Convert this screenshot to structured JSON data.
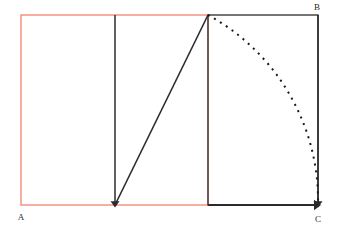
{
  "figure": {
    "width": 339,
    "height": 229,
    "background_color": "#ffffff"
  },
  "colors": {
    "red_rectangle": "#f2836b",
    "black_stroke": "#2b2b2b",
    "dashed_arc": "#1a1a1a",
    "label_text": "#2b2b2b"
  },
  "labels": [
    {
      "id": "A",
      "text": "A",
      "x": 21,
      "y": 220,
      "anchor": "middle",
      "description": "bottom-left vertex label"
    },
    {
      "id": "B",
      "text": "B",
      "x": 317,
      "y": 10,
      "anchor": "middle",
      "description": "top-right vertex label"
    },
    {
      "id": "C",
      "text": "C",
      "x": 318,
      "y": 222,
      "anchor": "middle",
      "description": "bottom-right vertex label"
    }
  ],
  "shapes": {
    "red_rectangle": {
      "name": "source-rectangle",
      "x": 21,
      "y": 15,
      "width": 187,
      "height": 190,
      "stroke": "#f2836b",
      "stroke_width": 1.3,
      "fill": "none"
    },
    "black_rectangle": {
      "name": "target-rectangle",
      "x": 208,
      "y": 15,
      "width": 110,
      "height": 190,
      "stroke": "#2b2b2b",
      "stroke_width": 1.3,
      "fill": "none"
    },
    "mid_vertical": {
      "name": "midpoint-vertical-line",
      "x1": 115,
      "y1": 15,
      "x2": 115,
      "y2": 205,
      "stroke": "#2b2b2b",
      "stroke_width": 1.5,
      "arrow_at_end": true
    },
    "diagonal": {
      "name": "diagonal-radius-line",
      "x1": 115,
      "y1": 205,
      "x2": 208,
      "y2": 15,
      "stroke": "#2b2b2b",
      "stroke_width": 1.6
    },
    "right_vertical": {
      "name": "right-edge-arrow-line",
      "x1": 318,
      "y1": 15,
      "x2": 318,
      "y2": 205,
      "stroke": "#2b2b2b",
      "stroke_width": 1.5,
      "arrow_at_end": true
    },
    "bottom_black": {
      "name": "bottom-edge-arrow-line",
      "x1": 208,
      "y1": 205,
      "x2": 318,
      "y2": 205,
      "stroke": "#2b2b2b",
      "stroke_width": 1.8,
      "arrow_at_end": true
    },
    "arc": {
      "name": "rotation-arc",
      "center_x": 115,
      "center_y": 205,
      "radius": 211,
      "start_x": 208,
      "start_y": 15,
      "end_x": 318,
      "end_y": 205,
      "path": "M 208 15 A 211 211 0 0 1 318 205",
      "stroke": "#1a1a1a",
      "stroke_width": 2,
      "dash_pattern": "2 5",
      "fill": "none"
    }
  }
}
